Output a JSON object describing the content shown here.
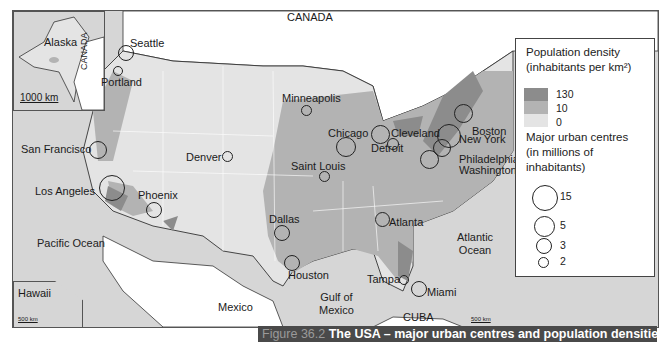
{
  "caption": {
    "figure_number": "Figure 36.2",
    "title": "The USA – major urban centres and population densities"
  },
  "colors": {
    "density_high": "#8c8c8c",
    "density_mid": "#b3b3b3",
    "density_low": "#e4e4e4",
    "ocean": "#d6d6d6",
    "foreign_land": "#ffffff",
    "caption_bg": "#4a4a4a"
  },
  "labels": {
    "canada": "CANADA",
    "mexico": "Mexico",
    "cuba": "CUBA",
    "pacific_ocean": "Pacific Ocean",
    "atlantic_ocean_1": "Atlantic",
    "atlantic_ocean_2": "Ocean",
    "gulf_1": "Gulf of",
    "gulf_2": "Mexico"
  },
  "insets": {
    "alaska": {
      "title": "Alaska",
      "canada": "CANADA",
      "scale": "1000 km"
    },
    "hawaii": {
      "title": "Hawaii",
      "scale": "500 km"
    },
    "main_scale": "500 km"
  },
  "cities": [
    {
      "name": "Seattle",
      "size_class": "3"
    },
    {
      "name": "Portland",
      "size_class": "2"
    },
    {
      "name": "San Francisco",
      "size_class": "5"
    },
    {
      "name": "Los Angeles",
      "size_class": "15"
    },
    {
      "name": "Phoenix",
      "size_class": "3"
    },
    {
      "name": "Denver",
      "size_class": "2"
    },
    {
      "name": "Minneapolis",
      "size_class": "2"
    },
    {
      "name": "Chicago",
      "size_class": "5"
    },
    {
      "name": "Detroit",
      "size_class": "5"
    },
    {
      "name": "Cleveland",
      "size_class": "3"
    },
    {
      "name": "Saint Louis",
      "size_class": "2"
    },
    {
      "name": "Boston",
      "size_class": "5"
    },
    {
      "name": "New York",
      "size_class": "15"
    },
    {
      "name": "Philadelphia",
      "size_class": "5"
    },
    {
      "name": "Washington DC",
      "size_class": "5"
    },
    {
      "name": "Atlanta",
      "size_class": "3"
    },
    {
      "name": "Dallas",
      "size_class": "3"
    },
    {
      "name": "Houston",
      "size_class": "3"
    },
    {
      "name": "Tampa",
      "size_class": "2"
    },
    {
      "name": "Miami",
      "size_class": "3"
    }
  ],
  "legend": {
    "density_title_1": "Population density",
    "density_title_2": "(inhabitants per km²)",
    "density_values": [
      "130",
      "10",
      "0"
    ],
    "urban_title_1": "Major urban centres",
    "urban_title_2": "(in millions of",
    "urban_title_3": "inhabitants)",
    "urban_sizes": [
      "15",
      "5",
      "3",
      "2"
    ]
  }
}
